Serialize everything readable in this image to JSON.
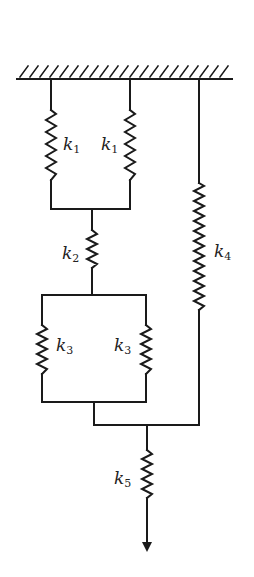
{
  "diagram": {
    "type": "spring-system",
    "colors": {
      "line": "#1a1a1a",
      "background": "#ffffff"
    },
    "springs": [
      {
        "id": "k1_left",
        "symbol": "k",
        "subscript": "1"
      },
      {
        "id": "k1_right",
        "symbol": "k",
        "subscript": "1"
      },
      {
        "id": "k2",
        "symbol": "k",
        "subscript": "2"
      },
      {
        "id": "k3_left",
        "symbol": "k",
        "subscript": "3"
      },
      {
        "id": "k3_right",
        "symbol": "k",
        "subscript": "3"
      },
      {
        "id": "k4",
        "symbol": "k",
        "subscript": "4"
      },
      {
        "id": "k5",
        "symbol": "k",
        "subscript": "5"
      }
    ],
    "support": "fixed-ceiling",
    "load": "downward-arrow"
  }
}
